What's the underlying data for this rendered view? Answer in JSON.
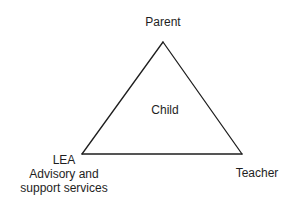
{
  "diagram": {
    "type": "triangle-relationship",
    "nodes": {
      "top": {
        "label": "Parent"
      },
      "center": {
        "label": "Child"
      },
      "bottom_left": {
        "lines": [
          "LEA",
          "Advisory and",
          "support services"
        ]
      },
      "bottom_right": {
        "label": "Teacher"
      }
    },
    "edges": [
      {
        "from": "Parent",
        "to": "LEA Advisory and support services"
      },
      {
        "from": "LEA Advisory and support services",
        "to": "Teacher"
      },
      {
        "from": "Teacher",
        "to": "Parent"
      }
    ],
    "colors": {
      "line": "#1e1e1e",
      "text": "#1e1e1e",
      "background": "#ffffff"
    }
  }
}
